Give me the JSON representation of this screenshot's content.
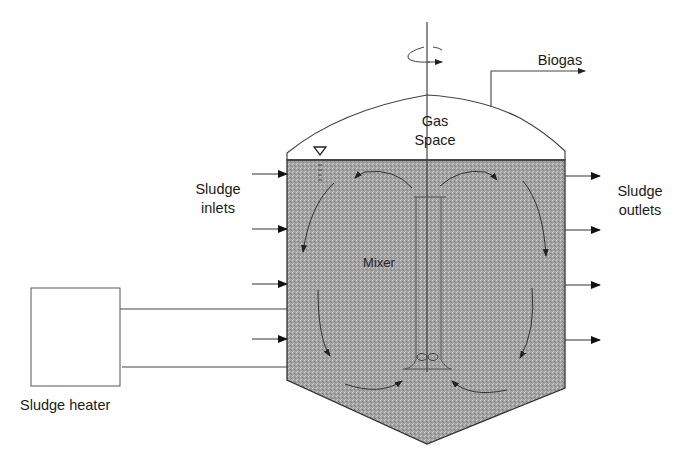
{
  "diagram": {
    "labels": {
      "biogas": "Biogas",
      "gas_space_line1": "Gas",
      "gas_space_line2": "Space",
      "sludge_inlets_line1": "Sludge",
      "sludge_inlets_line2": "inlets",
      "sludge_outlets_line1": "Sludge",
      "sludge_outlets_line2": "outlets",
      "mixer": "Mixer",
      "sludge_heater": "Sludge heater"
    },
    "icons": {
      "liquid_level": "inverted-triangle-water-level-icon",
      "rotation": "rotation-arrow-icon"
    },
    "counts": {
      "inlet_arrows": 4,
      "outlet_arrows": 4,
      "circulation_arrows": 6,
      "heater_pipes": 2
    },
    "colors": {
      "sludge_fill": "#9a9a9a",
      "line": "#333333",
      "background": "#ffffff"
    }
  }
}
